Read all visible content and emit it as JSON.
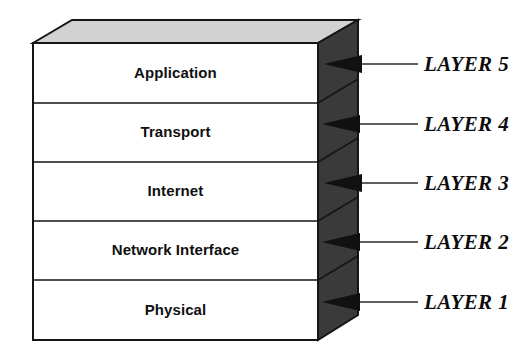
{
  "diagram": {
    "type": "layered-stack-3d",
    "colors": {
      "front_face": "#ffffff",
      "top_face": "#d2d2d2",
      "side_face": "#3a3a3a",
      "outline": "#151515",
      "text": "#101010",
      "leader_line": "#2a2a2a"
    },
    "layers": [
      {
        "index": 5,
        "name": "Application",
        "tag": "LAYER 5"
      },
      {
        "index": 4,
        "name": "Transport",
        "tag": "LAYER 4"
      },
      {
        "index": 3,
        "name": "Internet",
        "tag": "LAYER 3"
      },
      {
        "index": 2,
        "name": "Network Interface",
        "tag": "LAYER 2"
      },
      {
        "index": 1,
        "name": "Physical",
        "tag": "LAYER 1"
      }
    ]
  }
}
